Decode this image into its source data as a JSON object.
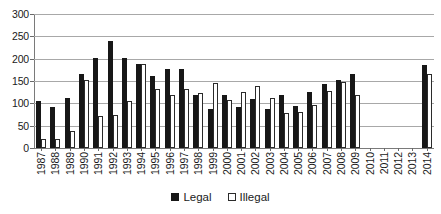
{
  "chart_data": {
    "type": "bar",
    "title": "",
    "subtitle": "",
    "xlabel": "",
    "ylabel": "",
    "ylim": [
      0,
      300
    ],
    "yticks": [
      0,
      50,
      100,
      150,
      200,
      250,
      300
    ],
    "grid": true,
    "legend_position": "bottom-center",
    "categories": [
      "1987",
      "1988",
      "1989",
      "1990",
      "1991",
      "1992",
      "1993",
      "1994",
      "1995",
      "1996",
      "1997",
      "1998",
      "1999",
      "2000",
      "2001",
      "2002",
      "2003",
      "2004",
      "2005",
      "2006",
      "2007",
      "2008",
      "2009",
      "2010",
      "2011",
      "2012",
      "2013",
      "2014"
    ],
    "series": [
      {
        "name": "Legal",
        "color": "#171717",
        "values": [
          105,
          91,
          112,
          166,
          202,
          240,
          201,
          187,
          161,
          178,
          178,
          118,
          88,
          118,
          92,
          110,
          87,
          118,
          94,
          125,
          143,
          152,
          165,
          null,
          null,
          null,
          null,
          185
        ]
      },
      {
        "name": "Illegal",
        "color": "#ffffff",
        "values": [
          20,
          21,
          38,
          153,
          71,
          74,
          106,
          189,
          132,
          119,
          133,
          123,
          146,
          108,
          126,
          138,
          112,
          79,
          80,
          96,
          128,
          147,
          118,
          null,
          null,
          null,
          null,
          165
        ]
      }
    ]
  },
  "axis": {
    "y_tick_labels": [
      "0",
      "50",
      "100",
      "150",
      "200",
      "250",
      "300"
    ]
  },
  "legend": {
    "items": [
      {
        "label": "Legal",
        "swatch": "filled-square-icon"
      },
      {
        "label": "Illegal",
        "swatch": "outlined-square-icon"
      }
    ]
  }
}
